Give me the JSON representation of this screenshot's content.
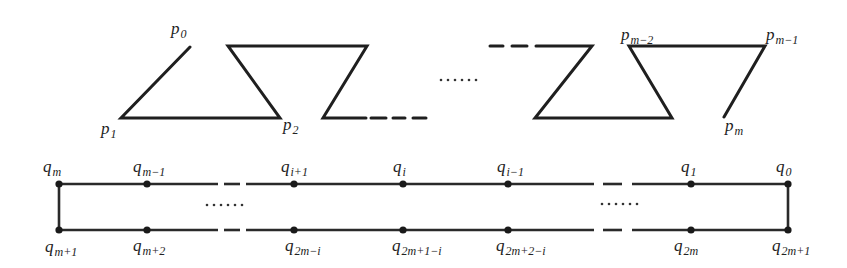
{
  "figure": {
    "top_polyline": {
      "description": "Zig-zag polygonal chain p0 ... pm",
      "labels": {
        "p0": {
          "base": "p",
          "sub": "0"
        },
        "p1": {
          "base": "p",
          "sub": "1"
        },
        "p2": {
          "base": "p",
          "sub": "2"
        },
        "pm2": {
          "base": "p",
          "sub": "m−2"
        },
        "pm1": {
          "base": "p",
          "sub": "m−1"
        },
        "pm": {
          "base": "p",
          "sub": "m"
        }
      },
      "ellipsis": "......"
    },
    "bottom_loop": {
      "description": "Closed rectangular loop with points q0 ... q2m+1",
      "top_labels": {
        "qm": {
          "base": "q",
          "sub": "m"
        },
        "qm1": {
          "base": "q",
          "sub": "m−1"
        },
        "qi1": {
          "base": "q",
          "sub": "i+1"
        },
        "qi": {
          "base": "q",
          "sub": "i"
        },
        "qim1": {
          "base": "q",
          "sub": "i−1"
        },
        "q1": {
          "base": "q",
          "sub": "1"
        },
        "q0": {
          "base": "q",
          "sub": "0"
        }
      },
      "bottom_labels": {
        "qm_p1": {
          "base": "q",
          "sub": "m+1"
        },
        "qm_p2": {
          "base": "q",
          "sub": "m+2"
        },
        "q2m_i": {
          "base": "q",
          "sub": "2m−i"
        },
        "q2m1_i": {
          "base": "q",
          "sub": "2m+1−i"
        },
        "q2m2_i": {
          "base": "q",
          "sub": "2m+2−i"
        },
        "q2m": {
          "base": "q",
          "sub": "2m"
        },
        "q2m1": {
          "base": "q",
          "sub": "2m+1"
        }
      },
      "ellipsis_left": "......",
      "ellipsis_right": "......"
    }
  }
}
